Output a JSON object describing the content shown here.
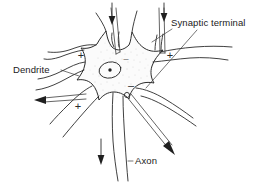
{
  "figure": {
    "background_color": "#ffffff",
    "ink_color": "#2b2b2b",
    "width": 264,
    "height": 183
  },
  "labels": {
    "synaptic_terminal": "Synaptic terminal",
    "dendrite": "Dendrite",
    "axon": "Axon"
  },
  "signs": {
    "plus_upper_left": "+",
    "plus_lower_left": "+",
    "plus_right": "+",
    "minus_top": "–",
    "minus_hillock": "–"
  },
  "parts": [
    {
      "name": "soma",
      "label": "cell body"
    },
    {
      "name": "nucleus",
      "label": "nucleus"
    },
    {
      "name": "nucleolus",
      "label": "nucleolus"
    },
    {
      "name": "axon",
      "label": "axon"
    },
    {
      "name": "dendrite-upper-left",
      "label": "dendrite"
    },
    {
      "name": "dendrite-lower-left",
      "label": "dendrite"
    },
    {
      "name": "dendrite-right",
      "label": "dendrite"
    },
    {
      "name": "synaptic-terminal-left",
      "label": "synaptic terminal"
    },
    {
      "name": "synaptic-terminal-right",
      "label": "synaptic terminal"
    }
  ],
  "electrodes": [
    {
      "name": "electrode-top-left",
      "direction": "down",
      "sign": "–"
    },
    {
      "name": "electrode-top-right",
      "direction": "down",
      "sign": "+"
    },
    {
      "name": "electrode-left",
      "direction": "left",
      "sign": "+"
    },
    {
      "name": "electrode-diagonal",
      "direction": "down-right",
      "sign": "–"
    },
    {
      "name": "axon-flow-arrow",
      "direction": "down",
      "sign": ""
    }
  ]
}
